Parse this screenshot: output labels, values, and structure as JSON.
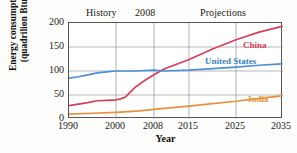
{
  "chart_data": {
    "type": "line",
    "title": "",
    "xlabel": "Year",
    "ylabel": "Energy consumption\n(quadrilion Btu)",
    "xlim": [
      1990,
      2035
    ],
    "ylim": [
      0,
      200
    ],
    "grid": true,
    "legend_position": "inline-right",
    "x_ticks": [
      1990,
      2000,
      2008,
      2015,
      2025,
      2035
    ],
    "x_tick_labels": [
      "1990",
      "2000",
      "2008",
      "2015",
      "2025",
      "2035"
    ],
    "y_ticks": [
      0,
      50,
      100,
      150,
      200
    ],
    "y_tick_labels": [
      "0",
      "50",
      "100",
      "150",
      "200"
    ],
    "annotations": [
      {
        "text": "History",
        "x": 1998
      },
      {
        "text": "2008",
        "x": 2006
      },
      {
        "text": "Projections",
        "x": 2021
      }
    ],
    "series": [
      {
        "name": "China",
        "color": "#d4405a",
        "label": "China",
        "x": [
          1990,
          1992,
          1994,
          1996,
          1998,
          2000,
          2001,
          2002,
          2003,
          2004,
          2005,
          2006,
          2008,
          2010,
          2012,
          2015,
          2018,
          2020,
          2025,
          2030,
          2035
        ],
        "values": [
          28,
          31,
          34,
          38,
          39,
          40,
          42,
          46,
          56,
          66,
          73,
          80,
          92,
          104,
          112,
          124,
          137,
          146,
          165,
          181,
          193
        ]
      },
      {
        "name": "United States",
        "color": "#4a90d9",
        "label": "United States",
        "x": [
          1990,
          1992,
          1994,
          1996,
          1998,
          2000,
          2004,
          2008,
          2010,
          2015,
          2020,
          2025,
          2030,
          2035
        ],
        "values": [
          85,
          88,
          92,
          96,
          98,
          100,
          100,
          102,
          100,
          102,
          105,
          108,
          112,
          115
        ]
      },
      {
        "name": "India",
        "color": "#e8913a",
        "label": "India",
        "x": [
          1990,
          1995,
          2000,
          2005,
          2008,
          2010,
          2015,
          2020,
          2025,
          2030,
          2035
        ],
        "values": [
          10,
          12,
          14,
          17,
          20,
          22,
          27,
          32,
          37,
          43,
          48
        ]
      }
    ]
  }
}
